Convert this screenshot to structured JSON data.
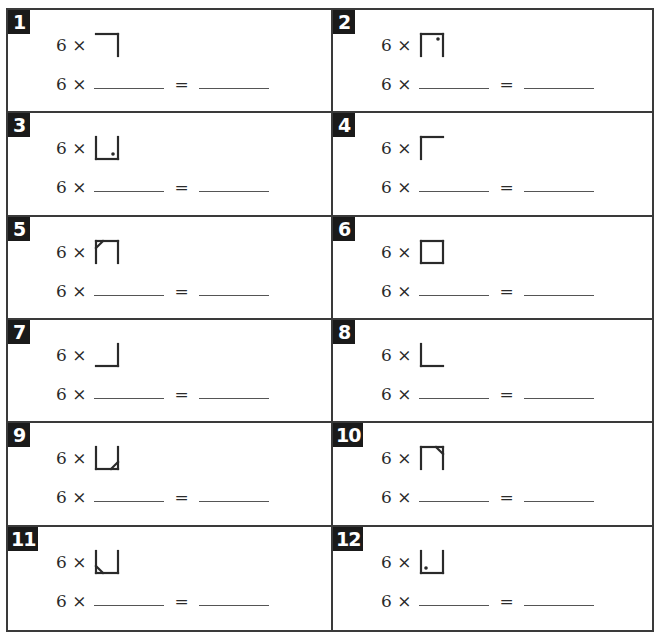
{
  "worksheet": {
    "problems": [
      {
        "number": "1",
        "multiplier": "6",
        "times": "×",
        "equals": "=",
        "glyph": {
          "top": true,
          "right": true,
          "bottom": false,
          "left": false,
          "mark": "none"
        }
      },
      {
        "number": "2",
        "multiplier": "6",
        "times": "×",
        "equals": "=",
        "glyph": {
          "top": true,
          "right": true,
          "bottom": false,
          "left": true,
          "mark": "dot-top-right"
        }
      },
      {
        "number": "3",
        "multiplier": "6",
        "times": "×",
        "equals": "=",
        "glyph": {
          "top": false,
          "right": true,
          "bottom": true,
          "left": true,
          "mark": "dot-bottom-right"
        }
      },
      {
        "number": "4",
        "multiplier": "6",
        "times": "×",
        "equals": "=",
        "glyph": {
          "top": true,
          "right": false,
          "bottom": false,
          "left": true,
          "mark": "none"
        }
      },
      {
        "number": "5",
        "multiplier": "6",
        "times": "×",
        "equals": "=",
        "glyph": {
          "top": true,
          "right": true,
          "bottom": false,
          "left": true,
          "mark": "diag-top-left"
        }
      },
      {
        "number": "6",
        "multiplier": "6",
        "times": "×",
        "equals": "=",
        "glyph": {
          "top": true,
          "right": true,
          "bottom": true,
          "left": true,
          "mark": "none"
        }
      },
      {
        "number": "7",
        "multiplier": "6",
        "times": "×",
        "equals": "=",
        "glyph": {
          "top": false,
          "right": true,
          "bottom": true,
          "left": false,
          "mark": "none"
        }
      },
      {
        "number": "8",
        "multiplier": "6",
        "times": "×",
        "equals": "=",
        "glyph": {
          "top": false,
          "right": false,
          "bottom": true,
          "left": true,
          "mark": "none"
        }
      },
      {
        "number": "9",
        "multiplier": "6",
        "times": "×",
        "equals": "=",
        "glyph": {
          "top": false,
          "right": true,
          "bottom": true,
          "left": true,
          "mark": "diag-bottom-right"
        }
      },
      {
        "number": "10",
        "multiplier": "6",
        "times": "×",
        "equals": "=",
        "glyph": {
          "top": true,
          "right": true,
          "bottom": false,
          "left": true,
          "mark": "diag-top-right"
        }
      },
      {
        "number": "11",
        "multiplier": "6",
        "times": "×",
        "equals": "=",
        "glyph": {
          "top": false,
          "right": true,
          "bottom": true,
          "left": true,
          "mark": "diag-bottom-left"
        }
      },
      {
        "number": "12",
        "multiplier": "6",
        "times": "×",
        "equals": "=",
        "glyph": {
          "top": false,
          "right": true,
          "bottom": true,
          "left": true,
          "mark": "dot-bottom-left"
        }
      }
    ],
    "answer_blank_first": "",
    "answer_blank_second": ""
  },
  "colors": {
    "ink": "#2a2a2a",
    "badge_bg": "#1a1a1a",
    "badge_fg": "#ffffff",
    "border": "#3a3a3a"
  }
}
